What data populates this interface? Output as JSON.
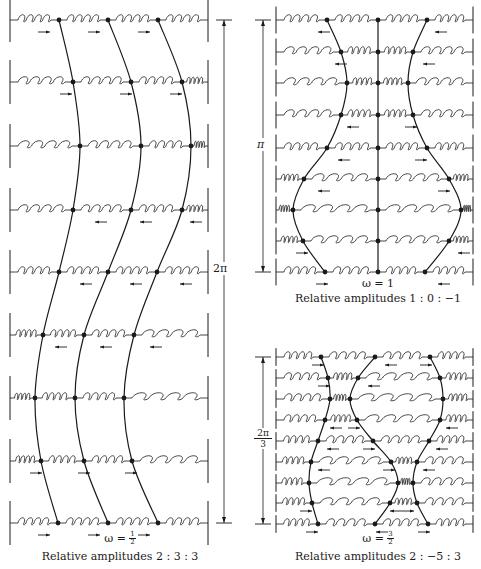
{
  "figure": {
    "colors": {
      "ink": "#1a1a1a",
      "background": "#ffffff"
    },
    "panels": [
      {
        "id": "panel-omega-half",
        "omega_label": "ω =",
        "omega_num": "1",
        "omega_den": "2",
        "caption": "Relative amplitudes 2 : 3 : 3",
        "dimension_label": "2π",
        "walls": {
          "left": 10,
          "right": 208
        },
        "dimension_x": 224,
        "rows_y": [
          20,
          82,
          146,
          210,
          272,
          335,
          398,
          461,
          523
        ],
        "masses_x": [
          [
            59,
            108,
            158
          ],
          [
            73,
            131,
            182
          ],
          [
            80,
            141,
            191
          ],
          [
            73,
            131,
            182
          ],
          [
            59,
            108,
            157
          ],
          [
            43,
            84,
            134
          ],
          [
            35,
            75,
            124
          ],
          [
            41,
            84,
            132
          ],
          [
            58,
            108,
            158
          ]
        ],
        "arrows": [
          [
            [
              "r",
              38
            ],
            [
              "r",
              88
            ],
            [
              "r",
              138
            ]
          ],
          [
            [
              "r",
              60
            ],
            [
              "r",
              120
            ],
            [
              "r",
              170
            ]
          ],
          [],
          [
            [
              "l",
              95
            ],
            [
              "l",
              140
            ],
            [
              "l",
              190
            ]
          ],
          [
            [
              "l",
              80
            ],
            [
              "l",
              130
            ],
            [
              "l",
              180
            ]
          ],
          [
            [
              "l",
              55
            ],
            [
              "l",
              100
            ],
            [
              "l",
              150
            ]
          ],
          [],
          [
            [
              "r",
              30
            ],
            [
              "r",
              78
            ],
            [
              "r",
              125
            ]
          ],
          [
            [
              "r",
              38
            ],
            [
              "r",
              88
            ],
            [
              "r",
              138
            ]
          ]
        ]
      },
      {
        "id": "panel-omega-one",
        "omega_label": "ω = 1",
        "caption": "Relative amplitudes 1 : 0 : −1",
        "dimension_label": "π",
        "walls": {
          "left": 276,
          "right": 473
        },
        "dimension_x": 263,
        "rows_y": [
          20,
          52,
          83,
          115,
          148,
          179,
          210,
          241,
          272
        ],
        "masses_x": [
          [
            327,
            378,
            427
          ],
          [
            341,
            378,
            413
          ],
          [
            347,
            378,
            408
          ],
          [
            341,
            378,
            413
          ],
          [
            327,
            378,
            427
          ],
          [
            304,
            378,
            449
          ],
          [
            293,
            378,
            461
          ],
          [
            303,
            378,
            449
          ],
          [
            325,
            378,
            425
          ]
        ],
        "arrows": [
          [
            [
              "l",
              318
            ],
            [
              "l",
              435
            ]
          ],
          [
            [
              "l",
              335
            ],
            [
              "l",
              423
            ]
          ],
          [],
          [
            [
              "l",
              347
            ],
            [
              "r",
              405
            ]
          ],
          [
            [
              "l",
              338
            ],
            [
              "r",
              415
            ]
          ],
          [
            [
              "l",
              318
            ],
            [
              "r",
              438
            ]
          ],
          [],
          [
            [
              "r",
              296
            ],
            [
              "l",
              458
            ]
          ],
          [
            [
              "r",
              316
            ],
            [
              "l",
              438
            ]
          ]
        ]
      },
      {
        "id": "panel-omega-three-halves",
        "omega_label": "ω =",
        "omega_num": "3",
        "omega_den": "2",
        "caption": "Relative amplitudes 2 : −5 : 3",
        "dimension_label_num": "2π",
        "dimension_label_den": "3",
        "walls": {
          "left": 276,
          "right": 473
        },
        "dimension_x": 263,
        "rows_y": [
          357,
          378,
          399,
          420,
          441,
          462,
          483,
          503,
          524
        ],
        "masses_x": [
          [
            321,
            375,
            430
          ],
          [
            328,
            358,
            440
          ],
          [
            330,
            350,
            443
          ],
          [
            325,
            357,
            440
          ],
          [
            318,
            373,
            429
          ],
          [
            311,
            391,
            417
          ],
          [
            309,
            398,
            413
          ],
          [
            312,
            390,
            417
          ],
          [
            318,
            375,
            428
          ]
        ],
        "arrows": [
          [
            [
              "r",
              312
            ],
            [
              "l",
              385
            ],
            [
              "r",
              420
            ]
          ],
          [
            [
              "r",
              318
            ],
            [
              "l",
              368
            ]
          ],
          [],
          [
            [
              "l",
              330
            ],
            [
              "r",
              348
            ],
            [
              "l",
              446
            ]
          ],
          [
            [
              "l",
              327
            ],
            [
              "r",
              363
            ],
            [
              "l",
              436
            ]
          ],
          [
            [
              "l",
              318
            ],
            [
              "r",
              383
            ],
            [
              "l",
              423
            ]
          ],
          [],
          [
            [
              "r",
              300
            ],
            [
              "l",
              390
            ],
            [
              "r",
              402
            ]
          ],
          [
            [
              "r",
              306
            ],
            [
              "l",
              376
            ],
            [
              "r",
              418
            ]
          ]
        ]
      }
    ],
    "caption_positions": [
      {
        "omega_x": 120,
        "omega_y": 538,
        "caption_x": 120,
        "caption_y": 552
      },
      {
        "omega_x": 378,
        "omega_y": 283,
        "caption_x": 378,
        "caption_y": 297
      },
      {
        "omega_x": 378,
        "omega_y": 535,
        "caption_x": 378,
        "caption_y": 553
      }
    ]
  }
}
